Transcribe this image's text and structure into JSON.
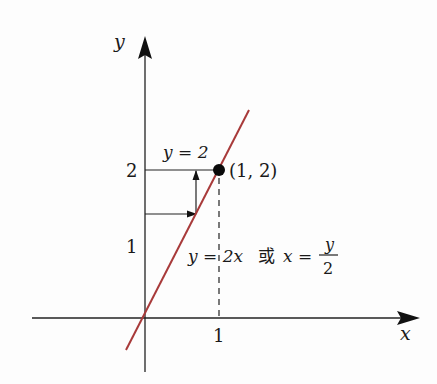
{
  "diagram": {
    "axes": {
      "x_label": "x",
      "y_label": "y",
      "x_tick": "1",
      "y_ticks": [
        "1",
        "2"
      ]
    },
    "line": {
      "equation_label_left": "y = 2x",
      "connector": "或",
      "equation_label_right_lhs": "x =",
      "fraction_numerator": "y",
      "fraction_denominator": "2",
      "color": "#a83a3a"
    },
    "point": {
      "label": "(1, 2)",
      "x": 1,
      "y": 2
    },
    "horizontal_line_label": "y = 2"
  }
}
